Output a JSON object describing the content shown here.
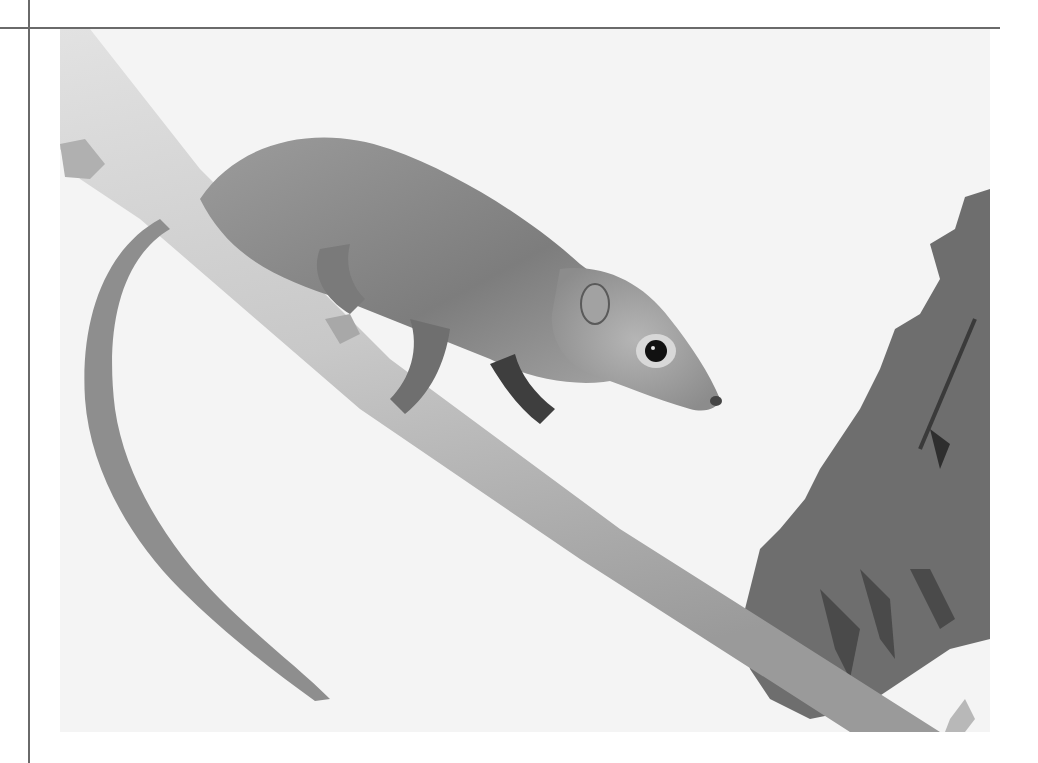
{
  "page": {
    "type": "scanned photograph",
    "colors": {
      "background": "#ffffff",
      "photo_bg": "#f3f3f3",
      "rule": "#6a6a6a",
      "branch": "#cfcfcf",
      "fur": "#8a8a8a",
      "foliage": "#6e6e6e",
      "eye": "#111111"
    }
  },
  "photo": {
    "subject": "treeshrew",
    "alt": "Treeshrew on a branch"
  }
}
